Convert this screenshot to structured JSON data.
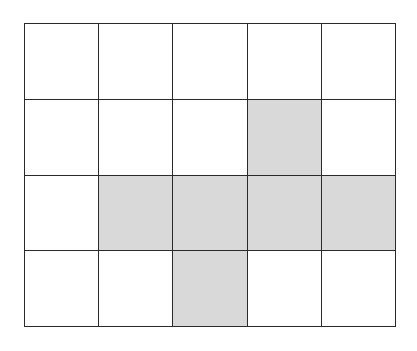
{
  "grid": {
    "rows": 4,
    "cols": 5,
    "colors": {
      "shaded": "#d9d9d9",
      "empty": "#ffffff",
      "line": "#2a2a2a"
    },
    "cells": [
      [
        0,
        0,
        0,
        0,
        0
      ],
      [
        0,
        0,
        0,
        1,
        0
      ],
      [
        0,
        1,
        1,
        1,
        1
      ],
      [
        0,
        0,
        1,
        0,
        0
      ]
    ]
  }
}
